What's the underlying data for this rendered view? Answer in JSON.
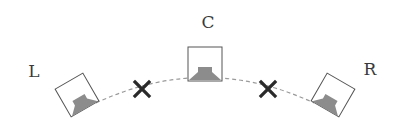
{
  "diagram": {
    "title": "",
    "speakers": [
      {
        "id": "L",
        "label": "L",
        "cx": 77,
        "cy": 95,
        "rotation": -30
      },
      {
        "id": "C",
        "label": "C",
        "cx": 205,
        "cy": 64,
        "rotation": 0
      },
      {
        "id": "R",
        "label": "R",
        "cx": 333,
        "cy": 95,
        "rotation": 30
      }
    ],
    "label_positions": {
      "L": {
        "x": 34,
        "y": 77
      },
      "C": {
        "x": 208,
        "y": 28
      },
      "R": {
        "x": 370,
        "y": 75
      }
    },
    "markers": [
      {
        "type": "x",
        "x": 142,
        "y": 89
      },
      {
        "type": "x",
        "x": 268,
        "y": 89
      }
    ],
    "colors": {
      "box_stroke": "#555555",
      "driver_fill": "#8c8c8c",
      "arc_stroke": "#9a9a9a",
      "marker": "#2a2a2a",
      "label": "#3a3a3a"
    }
  }
}
